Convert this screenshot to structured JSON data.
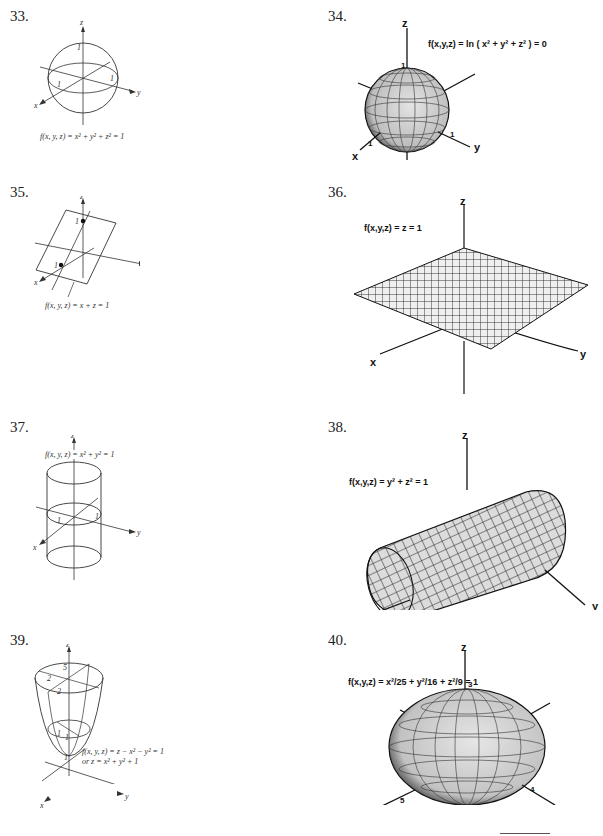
{
  "page": {
    "problems": [
      {
        "number": "33.",
        "equation": "f(x, y, z) = x² + y² + z² = 1",
        "axes": [
          "x",
          "y",
          "z"
        ],
        "ticks": [
          "1",
          "1",
          "1"
        ],
        "surface": "sphere (line drawing)"
      },
      {
        "number": "34.",
        "equation": "f(x,y,z) = ln ( x² + y² + z² ) = 0",
        "axes": [
          "x",
          "y",
          "z"
        ],
        "ticks": [
          "1",
          "1",
          "1"
        ],
        "surface": "sphere (mesh)"
      },
      {
        "number": "35.",
        "equation": "f(x, y, z) = x + z = 1",
        "axes": [
          "x",
          "y",
          "z"
        ],
        "ticks": [
          "1",
          "1"
        ],
        "surface": "plane (line drawing)"
      },
      {
        "number": "36.",
        "equation": "f(x,y,z) = z = 1",
        "axes": [
          "x",
          "y",
          "z"
        ],
        "ticks": [],
        "surface": "horizontal plane (mesh)"
      },
      {
        "number": "37.",
        "equation": "f(x, y, z) = x² + y² = 1",
        "axes": [
          "x",
          "y",
          "z"
        ],
        "ticks": [
          "1",
          "1"
        ],
        "surface": "cylinder along z (line drawing)"
      },
      {
        "number": "38.",
        "equation": "f(x,y,z) = y² + z² = 1",
        "axes": [
          "x",
          "y",
          "z"
        ],
        "ticks": [],
        "surface": "cylinder along x (mesh)"
      },
      {
        "number": "39.",
        "equation": "f(x, y, z) = z − x² − y² = 1",
        "equation_alt": "or z = x² + y² + 1",
        "axes": [
          "x",
          "y",
          "z"
        ],
        "ticks": [
          "5",
          "2",
          "2",
          "1",
          "1",
          "1"
        ],
        "surface": "paraboloid (line drawing)"
      },
      {
        "number": "40.",
        "equation": "f(x,y,z) = x²/25 + y²/16 + z²/9 = 1",
        "axes": [
          "x",
          "y",
          "z"
        ],
        "ticks": [
          "5",
          "4",
          "3"
        ],
        "surface": "ellipsoid (mesh)"
      }
    ]
  }
}
